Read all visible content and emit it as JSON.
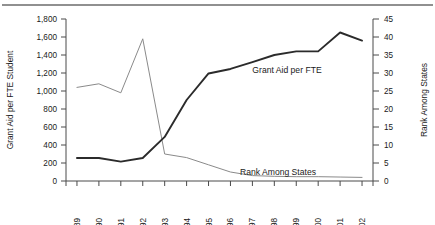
{
  "chart_data": {
    "type": "line",
    "title": "",
    "xlabel": "",
    "categories": [
      "1989",
      "1990",
      "1991",
      "1992",
      "1993",
      "1994",
      "1995",
      "1996",
      "1997",
      "1998",
      "1999",
      "2000",
      "2001",
      "2002"
    ],
    "grid": false,
    "legend_position": "inline-annotations",
    "axes": {
      "left": {
        "label": "Grant Aid per FTE Student",
        "ylim": [
          0,
          1800
        ],
        "ticks": [
          "0",
          "200",
          "400",
          "600",
          "800",
          "1,000",
          "1,200",
          "1,400",
          "1,600",
          "1,800"
        ],
        "tick_values": [
          0,
          200,
          400,
          600,
          800,
          1000,
          1200,
          1400,
          1600,
          1800
        ]
      },
      "right": {
        "label": "Rank Among States",
        "ylim": [
          0,
          45
        ],
        "ticks": [
          "0",
          "5",
          "10",
          "15",
          "20",
          "25",
          "30",
          "35",
          "40",
          "45"
        ],
        "tick_values": [
          0,
          5,
          10,
          15,
          20,
          25,
          30,
          35,
          40,
          45
        ]
      }
    },
    "series": [
      {
        "name": "Grant Aid per FTE",
        "axis": "left",
        "color": "#2b2b2b",
        "annotation": "Grant Aid per FTE",
        "values": [
          255,
          255,
          215,
          255,
          490,
          900,
          1195,
          1245,
          1320,
          1400,
          1440,
          1440,
          1650,
          1560
        ]
      },
      {
        "name": "Rank Among States",
        "axis": "right",
        "color": "#8a8a8a",
        "annotation": "Rank Among States",
        "values": [
          26,
          27,
          24.5,
          39.5,
          7.5,
          6.5,
          4.5,
          2.5,
          1.5,
          1.3,
          1.2,
          1.2,
          1.1,
          1.0
        ]
      }
    ],
    "annotations": [
      {
        "text": "Grant Aid per FTE",
        "x": 1995.2,
        "y_px": 70
      },
      {
        "text": "Rank Among States",
        "x": 1994.6,
        "y_px": 172
      }
    ]
  }
}
